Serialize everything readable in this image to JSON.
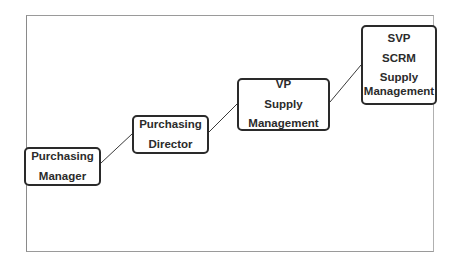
{
  "diagram": {
    "type": "career-ladder",
    "nodes": [
      {
        "id": "purchasing-manager",
        "lines": [
          "Purchasing",
          "Manager"
        ]
      },
      {
        "id": "purchasing-director",
        "lines": [
          "Purchasing",
          "Director"
        ]
      },
      {
        "id": "vp-supply-management",
        "lines": [
          "VP",
          "Supply",
          "Management"
        ]
      },
      {
        "id": "svp-scrm-supply-management",
        "lines": [
          "SVP",
          "SCRM",
          "Supply",
          "Management"
        ]
      }
    ],
    "edges": [
      {
        "from": "purchasing-manager",
        "to": "purchasing-director"
      },
      {
        "from": "purchasing-director",
        "to": "vp-supply-management"
      },
      {
        "from": "vp-supply-management",
        "to": "svp-scrm-supply-management"
      }
    ],
    "colors": {
      "box_border": "#2a2a2a",
      "frame": "#9a9a9a",
      "text": "#2b2b2b",
      "line": "#3a3a3a"
    }
  }
}
